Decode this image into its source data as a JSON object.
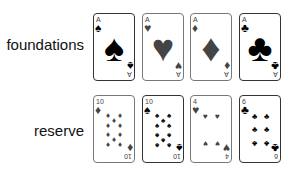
{
  "labels": {
    "foundations": "foundations",
    "reserve": "reserve"
  },
  "suit_glyphs": {
    "spade": "♠",
    "heart": "♥",
    "diamond": "♦",
    "club": "♣"
  },
  "foundations": [
    {
      "rank": "A",
      "suit": "spade",
      "glyph": "♠"
    },
    {
      "rank": "A",
      "suit": "heart",
      "glyph": "♥"
    },
    {
      "rank": "A",
      "suit": "diamond",
      "glyph": "♦"
    },
    {
      "rank": "A",
      "suit": "club",
      "glyph": "♣"
    }
  ],
  "reserve": [
    {
      "rank": "10",
      "suit": "diamond",
      "glyph": "♦"
    },
    {
      "rank": "10",
      "suit": "spade",
      "glyph": "♠"
    },
    {
      "rank": "4",
      "suit": "heart",
      "glyph": "♥"
    },
    {
      "rank": "6",
      "suit": "club",
      "glyph": "♣"
    }
  ],
  "colors": {
    "black_suit": "#000000",
    "red_suit_grayscale": "#444444",
    "card_border": "#777777"
  }
}
